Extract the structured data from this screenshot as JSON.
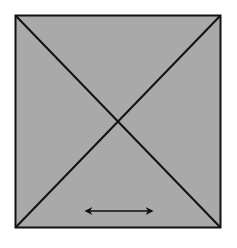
{
  "diagram": {
    "square": {
      "x": 15,
      "y": 15,
      "width": 206,
      "height": 213,
      "fill": "#a9a9a9",
      "stroke": "#111111"
    },
    "diagonals": [
      {
        "from": [
          15,
          15
        ],
        "to": [
          221,
          228
        ]
      },
      {
        "from": [
          221,
          15
        ],
        "to": [
          15,
          228
        ]
      }
    ],
    "arrow": {
      "type": "double-headed-horizontal",
      "from": [
        84,
        211
      ],
      "to": [
        154,
        211
      ],
      "color": "#111111"
    }
  }
}
